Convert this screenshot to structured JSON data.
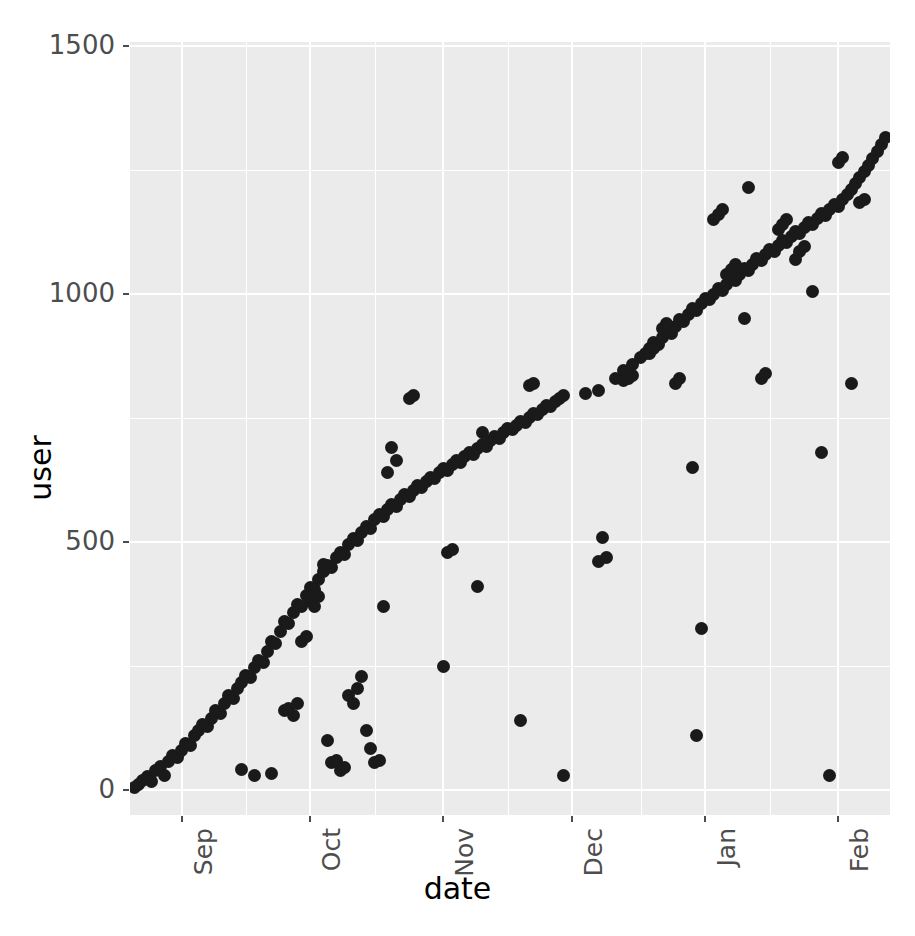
{
  "chart_data": {
    "type": "scatter",
    "title": "",
    "xlabel": "date",
    "ylabel": "user",
    "grid": true,
    "legend": false,
    "point_color": "#1A1A1A",
    "panel_color": "#EBEBEB",
    "gridline_color": "#FFFFFF",
    "x_tick_labels": [
      "Sep",
      "Oct",
      "Nov",
      "Dec",
      "Jan",
      "Feb"
    ],
    "x_tick_values": [
      31,
      61,
      92,
      122,
      153,
      184
    ],
    "x_axis_type": "date",
    "xlim": [
      19,
      196
    ],
    "y_tick_labels": [
      "0",
      "500",
      "1000",
      "1500"
    ],
    "y_tick_values": [
      0,
      500,
      1000,
      1500
    ],
    "ylim": [
      -50,
      1508
    ],
    "x_minor_ticks": [
      46,
      76,
      107,
      138,
      168
    ],
    "y_minor_ticks": [
      250,
      750,
      1250
    ],
    "series": [
      {
        "name": "users",
        "description": "signup id vs first-activity date",
        "points": [
          [
            20,
            5
          ],
          [
            21,
            12
          ],
          [
            22,
            20
          ],
          [
            23,
            28
          ],
          [
            24,
            18
          ],
          [
            25,
            40
          ],
          [
            26,
            48
          ],
          [
            27,
            30
          ],
          [
            28,
            58
          ],
          [
            29,
            70
          ],
          [
            30,
            66
          ],
          [
            31,
            80
          ],
          [
            32,
            95
          ],
          [
            33,
            90
          ],
          [
            34,
            110
          ],
          [
            35,
            120
          ],
          [
            36,
            132
          ],
          [
            37,
            128
          ],
          [
            38,
            145
          ],
          [
            39,
            160
          ],
          [
            40,
            155
          ],
          [
            41,
            175
          ],
          [
            42,
            190
          ],
          [
            43,
            185
          ],
          [
            44,
            205
          ],
          [
            45,
            218
          ],
          [
            46,
            232
          ],
          [
            47,
            228
          ],
          [
            48,
            248
          ],
          [
            49,
            262
          ],
          [
            50,
            258
          ],
          [
            51,
            280
          ],
          [
            52,
            300
          ],
          [
            53,
            295
          ],
          [
            54,
            320
          ],
          [
            55,
            340
          ],
          [
            56,
            335
          ],
          [
            57,
            358
          ],
          [
            58,
            375
          ],
          [
            59,
            370
          ],
          [
            60,
            392
          ],
          [
            61,
            408
          ],
          [
            62,
            404
          ],
          [
            63,
            425
          ],
          [
            64,
            440
          ],
          [
            65,
            452
          ],
          [
            66,
            448
          ],
          [
            67,
            468
          ],
          [
            68,
            480
          ],
          [
            69,
            476
          ],
          [
            70,
            495
          ],
          [
            71,
            508
          ],
          [
            72,
            504
          ],
          [
            73,
            520
          ],
          [
            74,
            532
          ],
          [
            75,
            528
          ],
          [
            76,
            545
          ],
          [
            77,
            556
          ],
          [
            78,
            552
          ],
          [
            79,
            566
          ],
          [
            80,
            575
          ],
          [
            81,
            572
          ],
          [
            82,
            585
          ],
          [
            83,
            595
          ],
          [
            84,
            592
          ],
          [
            85,
            604
          ],
          [
            86,
            614
          ],
          [
            87,
            610
          ],
          [
            88,
            622
          ],
          [
            89,
            630
          ],
          [
            90,
            628
          ],
          [
            91,
            640
          ],
          [
            92,
            648
          ],
          [
            93,
            645
          ],
          [
            94,
            656
          ],
          [
            95,
            664
          ],
          [
            96,
            661
          ],
          [
            97,
            672
          ],
          [
            98,
            680
          ],
          [
            99,
            677
          ],
          [
            100,
            688
          ],
          [
            101,
            696
          ],
          [
            102,
            693
          ],
          [
            103,
            704
          ],
          [
            104,
            712
          ],
          [
            105,
            709
          ],
          [
            106,
            720
          ],
          [
            107,
            728
          ],
          [
            108,
            726
          ],
          [
            109,
            736
          ],
          [
            110,
            744
          ],
          [
            111,
            742
          ],
          [
            112,
            752
          ],
          [
            113,
            760
          ],
          [
            114,
            758
          ],
          [
            115,
            768
          ],
          [
            116,
            776
          ],
          [
            117,
            774
          ],
          [
            118,
            784
          ],
          [
            119,
            790
          ],
          [
            120,
            796
          ],
          [
            125,
            800
          ],
          [
            128,
            805
          ],
          [
            132,
            830
          ],
          [
            134,
            845
          ],
          [
            136,
            858
          ],
          [
            138,
            872
          ],
          [
            139,
            880
          ],
          [
            140,
            890
          ],
          [
            141,
            902
          ],
          [
            142,
            898
          ],
          [
            143,
            912
          ],
          [
            144,
            925
          ],
          [
            145,
            920
          ],
          [
            146,
            935
          ],
          [
            147,
            948
          ],
          [
            148,
            944
          ],
          [
            149,
            958
          ],
          [
            150,
            970
          ],
          [
            151,
            966
          ],
          [
            152,
            980
          ],
          [
            153,
            992
          ],
          [
            154,
            988
          ],
          [
            155,
            1000
          ],
          [
            156,
            1012
          ],
          [
            157,
            1008
          ],
          [
            158,
            1020
          ],
          [
            159,
            1032
          ],
          [
            160,
            1028
          ],
          [
            161,
            1040
          ],
          [
            162,
            1052
          ],
          [
            163,
            1048
          ],
          [
            164,
            1060
          ],
          [
            165,
            1072
          ],
          [
            166,
            1068
          ],
          [
            167,
            1080
          ],
          [
            168,
            1090
          ],
          [
            169,
            1086
          ],
          [
            170,
            1098
          ],
          [
            171,
            1108
          ],
          [
            172,
            1104
          ],
          [
            173,
            1116
          ],
          [
            174,
            1126
          ],
          [
            175,
            1122
          ],
          [
            176,
            1134
          ],
          [
            177,
            1144
          ],
          [
            178,
            1140
          ],
          [
            179,
            1152
          ],
          [
            180,
            1162
          ],
          [
            181,
            1158
          ],
          [
            182,
            1170
          ],
          [
            183,
            1180
          ],
          [
            184,
            1176
          ],
          [
            185,
            1190
          ],
          [
            186,
            1200
          ],
          [
            187,
            1210
          ],
          [
            188,
            1222
          ],
          [
            189,
            1234
          ],
          [
            190,
            1246
          ],
          [
            191,
            1260
          ],
          [
            192,
            1274
          ],
          [
            193,
            1288
          ],
          [
            194,
            1302
          ],
          [
            195,
            1316
          ],
          [
            45,
            42
          ],
          [
            48,
            30
          ],
          [
            52,
            34
          ],
          [
            55,
            160
          ],
          [
            56,
            165
          ],
          [
            57,
            150
          ],
          [
            58,
            175
          ],
          [
            59,
            300
          ],
          [
            60,
            310
          ],
          [
            61,
            380
          ],
          [
            62,
            370
          ],
          [
            63,
            390
          ],
          [
            64,
            455
          ],
          [
            65,
            100
          ],
          [
            66,
            55
          ],
          [
            67,
            60
          ],
          [
            68,
            40
          ],
          [
            69,
            45
          ],
          [
            70,
            190
          ],
          [
            71,
            175
          ],
          [
            72,
            205
          ],
          [
            73,
            230
          ],
          [
            74,
            120
          ],
          [
            75,
            85
          ],
          [
            76,
            55
          ],
          [
            77,
            60
          ],
          [
            78,
            370
          ],
          [
            79,
            640
          ],
          [
            80,
            690
          ],
          [
            81,
            665
          ],
          [
            84,
            790
          ],
          [
            85,
            795
          ],
          [
            92,
            250
          ],
          [
            93,
            480
          ],
          [
            94,
            485
          ],
          [
            100,
            410
          ],
          [
            101,
            720
          ],
          [
            110,
            140
          ],
          [
            112,
            815
          ],
          [
            113,
            820
          ],
          [
            120,
            30
          ],
          [
            128,
            460
          ],
          [
            129,
            510
          ],
          [
            130,
            470
          ],
          [
            134,
            825
          ],
          [
            135,
            830
          ],
          [
            136,
            835
          ],
          [
            140,
            880
          ],
          [
            141,
            890
          ],
          [
            143,
            930
          ],
          [
            144,
            940
          ],
          [
            146,
            820
          ],
          [
            147,
            830
          ],
          [
            150,
            650
          ],
          [
            151,
            110
          ],
          [
            152,
            325
          ],
          [
            155,
            1150
          ],
          [
            156,
            1160
          ],
          [
            157,
            1170
          ],
          [
            158,
            1040
          ],
          [
            159,
            1050
          ],
          [
            160,
            1060
          ],
          [
            162,
            950
          ],
          [
            163,
            1215
          ],
          [
            166,
            830
          ],
          [
            167,
            840
          ],
          [
            170,
            1130
          ],
          [
            171,
            1140
          ],
          [
            172,
            1150
          ],
          [
            174,
            1070
          ],
          [
            175,
            1085
          ],
          [
            176,
            1095
          ],
          [
            178,
            1005
          ],
          [
            180,
            680
          ],
          [
            182,
            30
          ],
          [
            184,
            1265
          ],
          [
            185,
            1275
          ],
          [
            187,
            820
          ],
          [
            189,
            1185
          ],
          [
            190,
            1190
          ]
        ]
      }
    ]
  },
  "axes": {
    "x_title": "date",
    "y_title": "user"
  }
}
